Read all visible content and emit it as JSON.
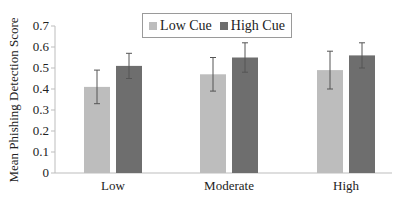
{
  "chart_data": {
    "type": "bar",
    "title": "",
    "xlabel": "",
    "ylabel": "Mean Phishing Detection Score",
    "ylim": [
      0,
      0.7
    ],
    "yticks": [
      "0",
      "0.1",
      "0.2",
      "0.3",
      "0.4",
      "0.5",
      "0.6",
      "0.7"
    ],
    "grid": false,
    "legend_position": "top-center",
    "categories": [
      "Low",
      "Moderate",
      "High"
    ],
    "series": [
      {
        "name": "Low Cue",
        "color": "#bdbdbd",
        "values": [
          0.41,
          0.47,
          0.49
        ],
        "error_low": [
          0.33,
          0.39,
          0.4
        ],
        "error_high": [
          0.49,
          0.55,
          0.58
        ]
      },
      {
        "name": "High Cue",
        "color": "#6e6e6e",
        "values": [
          0.51,
          0.55,
          0.56
        ],
        "error_low": [
          0.45,
          0.48,
          0.5
        ],
        "error_high": [
          0.57,
          0.62,
          0.62
        ]
      }
    ]
  }
}
